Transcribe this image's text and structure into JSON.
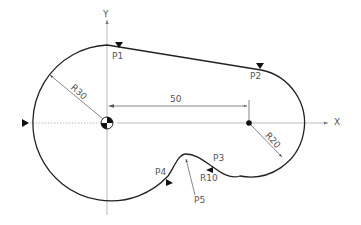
{
  "diagram": {
    "type": "cnc-contour-drawing",
    "axes": {
      "x_label": "X",
      "y_label": "Y"
    },
    "dimensions": {
      "center_distance": "50",
      "big_radius": "R30",
      "small_radius": "R20",
      "fillet_radius": "R10"
    },
    "points": {
      "p1": "P1",
      "p2": "P2",
      "p3": "P3",
      "p4": "P4",
      "p5": "P5"
    },
    "colors": {
      "contour": "#222222",
      "axis": "#999999",
      "dimension": "#555555",
      "label": "#555555"
    }
  }
}
